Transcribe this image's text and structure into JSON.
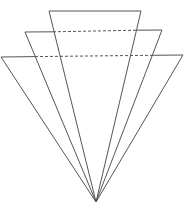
{
  "diagram": {
    "stroke_color": "#555555",
    "background": "#ffffff",
    "apex": [
      96,
      202
    ],
    "triangles": [
      {
        "name": "back",
        "top_left": [
          1,
          57
        ],
        "top_right": [
          183,
          55
        ],
        "top_edge_style": "partially-hidden"
      },
      {
        "name": "middle",
        "top_left": [
          25,
          32
        ],
        "top_right": [
          162,
          30
        ],
        "top_edge_style": "partially-hidden"
      },
      {
        "name": "front",
        "top_left": [
          49,
          11
        ],
        "top_right": [
          141,
          11
        ],
        "top_edge_style": "solid"
      }
    ]
  }
}
